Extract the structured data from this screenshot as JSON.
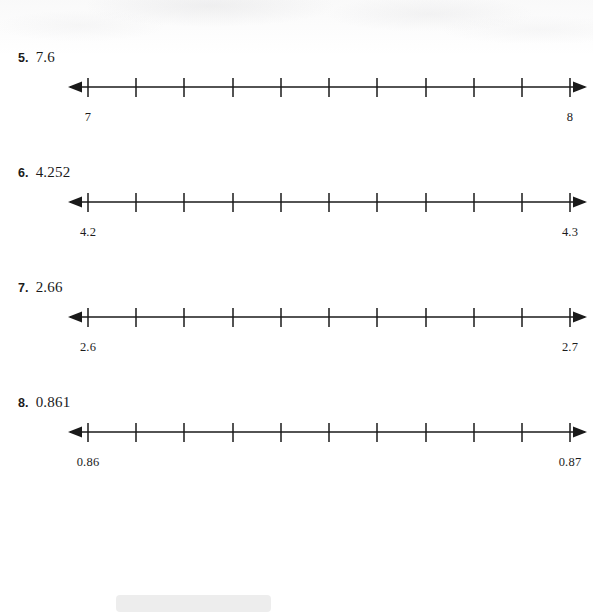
{
  "page": {
    "background_color": "#ffffff",
    "ink_color": "#1a1a1a",
    "bottom_bar_color": "#ededed"
  },
  "problems": [
    {
      "number": "5.",
      "value": "7.6",
      "line": {
        "left_label": "7",
        "right_label": "8",
        "ticks": 11,
        "intervals": 10,
        "left_arrow": true,
        "right_arrow": true
      }
    },
    {
      "number": "6.",
      "value": "4.252",
      "line": {
        "left_label": "4.2",
        "right_label": "4.3",
        "ticks": 11,
        "intervals": 10,
        "left_arrow": true,
        "right_arrow": true
      }
    },
    {
      "number": "7.",
      "value": "2.66",
      "line": {
        "left_label": "2.6",
        "right_label": "2.7",
        "ticks": 11,
        "intervals": 10,
        "left_arrow": true,
        "right_arrow": true
      }
    },
    {
      "number": "8.",
      "value": "0.861",
      "line": {
        "left_label": "0.86",
        "right_label": "0.87",
        "ticks": 11,
        "intervals": 10,
        "left_arrow": true,
        "right_arrow": true
      }
    }
  ]
}
